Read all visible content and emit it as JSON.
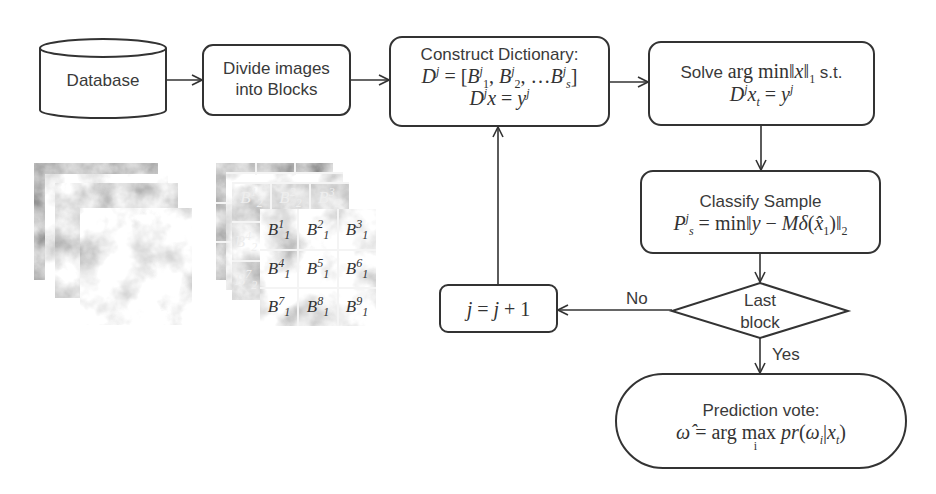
{
  "diagram": {
    "nodes": {
      "database": {
        "label": "Database",
        "shape": "cylinder"
      },
      "divide": {
        "line1": "Divide images",
        "line2": "into Blocks",
        "shape": "rounded-rect"
      },
      "construct": {
        "title": "Construct Dictionary:",
        "eq1": "D^j = [B_1^j, B_2^j, ...B_s^j]",
        "eq2": "D^j x = y^j",
        "shape": "rounded-rect"
      },
      "solve": {
        "line1": "Solve arg min||x||_1 s.t.",
        "line2": "D^j x_t = y^j",
        "shape": "rounded-rect"
      },
      "classify": {
        "title": "Classify Sample",
        "eq": "P_s^j = min||y − Mδ(x̂_1)||_2",
        "shape": "rounded-rect"
      },
      "decision": {
        "line1": "Last",
        "line2": "block",
        "shape": "diamond"
      },
      "increment": {
        "eq": "j = j + 1",
        "shape": "rounded-rect"
      },
      "prediction": {
        "title": "Prediction vote:",
        "eq": "ω̂ = arg max_i pr(ω_i|x_t)",
        "shape": "stadium"
      }
    },
    "edges": [
      {
        "from": "database",
        "to": "divide"
      },
      {
        "from": "divide",
        "to": "construct"
      },
      {
        "from": "construct",
        "to": "solve"
      },
      {
        "from": "solve",
        "to": "classify"
      },
      {
        "from": "classify",
        "to": "decision"
      },
      {
        "from": "decision",
        "to": "increment",
        "label": "No"
      },
      {
        "from": "increment",
        "to": "construct"
      },
      {
        "from": "decision",
        "to": "prediction",
        "label": "Yes"
      }
    ],
    "edge_labels": {
      "no": "No",
      "yes": "Yes"
    },
    "illustrations": {
      "image_stack": {
        "layers": 4,
        "description": "stack of grayscale texture images"
      },
      "block_stack": {
        "back_blocks": [
          "B_2^1",
          "B_2^2",
          "B_2^3",
          "B_2^4",
          "B_2^7"
        ],
        "front_blocks": [
          "B_1^1",
          "B_1^2",
          "B_1^3",
          "B_1^4",
          "B_1^5",
          "B_1^6",
          "B_1^7",
          "B_1^8",
          "B_1^9"
        ]
      }
    }
  }
}
